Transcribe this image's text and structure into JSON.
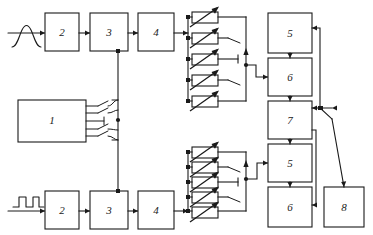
{
  "diagram": {
    "canvas": {
      "width": 373,
      "height": 235
    },
    "ink_color": "#1a1a1a",
    "background_color": "#ffffff"
  },
  "inputs": [
    {
      "id": "input-top",
      "waveform": "bell-pulse-waveform",
      "position": "top-left",
      "feeds": "block-2-top"
    },
    {
      "id": "input-bottom",
      "waveform": "square-pulse-waveform",
      "position": "bottom-left",
      "feeds": "block-2-bottom"
    }
  ],
  "blocks": [
    {
      "id": "block-1",
      "label": "1",
      "row": "middle-left",
      "x": 18,
      "y": 100,
      "w": 68,
      "h": 42
    },
    {
      "id": "block-2-top",
      "label": "2",
      "row": "top",
      "x": 45,
      "y": 13,
      "w": 34,
      "h": 38
    },
    {
      "id": "block-3-top",
      "label": "3",
      "row": "top",
      "x": 90,
      "y": 13,
      "w": 38,
      "h": 38
    },
    {
      "id": "block-4-top",
      "label": "4",
      "row": "top",
      "x": 138,
      "y": 13,
      "w": 36,
      "h": 38
    },
    {
      "id": "block-2-bottom",
      "label": "2",
      "row": "bottom",
      "x": 45,
      "y": 191,
      "w": 34,
      "h": 38
    },
    {
      "id": "block-3-bottom",
      "label": "3",
      "row": "bottom",
      "x": 90,
      "y": 191,
      "w": 38,
      "h": 38
    },
    {
      "id": "block-4-bottom",
      "label": "4",
      "row": "bottom",
      "x": 138,
      "y": 191,
      "w": 36,
      "h": 38
    },
    {
      "id": "block-5-top",
      "label": "5",
      "row": "right",
      "x": 268,
      "y": 13,
      "w": 44,
      "h": 40
    },
    {
      "id": "block-6-top",
      "label": "6",
      "row": "right",
      "x": 268,
      "y": 58,
      "w": 44,
      "h": 38
    },
    {
      "id": "block-7",
      "label": "7",
      "row": "right",
      "x": 268,
      "y": 101,
      "w": 44,
      "h": 38
    },
    {
      "id": "block-5-bottom",
      "label": "5",
      "row": "right",
      "x": 268,
      "y": 144,
      "w": 44,
      "h": 38
    },
    {
      "id": "block-6-bottom",
      "label": "6",
      "row": "right",
      "x": 268,
      "y": 187,
      "w": 44,
      "h": 40
    },
    {
      "id": "block-8",
      "label": "8",
      "row": "right",
      "x": 324,
      "y": 187,
      "w": 40,
      "h": 40
    }
  ],
  "attenuator_arrays": [
    {
      "id": "attenuator-array-top",
      "label": "variable attenuator bank (top)",
      "element_count": 5,
      "element_symbol": "variable-resistor",
      "rows": [
        {
          "index": 1,
          "right_termination": "bus"
        },
        {
          "index": 2,
          "right_termination": "switch-contact"
        },
        {
          "index": 3,
          "right_termination": "open-stub"
        },
        {
          "index": 4,
          "right_termination": "switch-contact"
        },
        {
          "index": 5,
          "right_termination": "bus"
        }
      ]
    },
    {
      "id": "attenuator-array-bottom",
      "label": "variable attenuator bank (bottom)",
      "element_count": 5,
      "element_symbol": "variable-resistor",
      "rows": [
        {
          "index": 1,
          "right_termination": "bus"
        },
        {
          "index": 2,
          "right_termination": "switch-contact"
        },
        {
          "index": 3,
          "right_termination": "open-stub"
        },
        {
          "index": 4,
          "right_termination": "switch-contact"
        },
        {
          "index": 5,
          "right_termination": "bus"
        }
      ]
    }
  ],
  "switches": [
    {
      "id": "switch-bank-block-1",
      "label": "block 1 output switch fan-out",
      "contact_count": 5,
      "closed_contacts": [
        3
      ],
      "open_contacts": [
        1,
        2,
        4,
        5
      ]
    },
    {
      "id": "switch-mode-selector",
      "label": "mode selector switch",
      "type": "spdt",
      "pole": "block-7-output",
      "throw_a": "feedback-loop",
      "throw_b": "block-8"
    }
  ],
  "connections": [
    {
      "from": "input-top",
      "to": "block-2-top"
    },
    {
      "from": "block-2-top",
      "to": "block-3-top"
    },
    {
      "from": "block-3-top",
      "to": "block-4-top"
    },
    {
      "from": "block-4-top",
      "to": "attenuator-array-top"
    },
    {
      "from": "attenuator-array-top",
      "to": "block-6-top"
    },
    {
      "from": "block-5-top",
      "to": "block-6-top"
    },
    {
      "from": "block-6-top",
      "to": "block-7"
    },
    {
      "from": "block-7",
      "to": "block-5-bottom"
    },
    {
      "from": "block-5-bottom",
      "to": "block-6-bottom"
    },
    {
      "from": "input-bottom",
      "to": "block-2-bottom"
    },
    {
      "from": "block-2-bottom",
      "to": "block-3-bottom"
    },
    {
      "from": "block-3-bottom",
      "to": "block-4-bottom"
    },
    {
      "from": "block-4-bottom",
      "to": "attenuator-array-bottom"
    },
    {
      "from": "attenuator-array-bottom",
      "to": "block-5-bottom"
    },
    {
      "from": "block-1",
      "to": "switch-bank-block-1"
    },
    {
      "from": "switch-bank-block-1",
      "to": "block-3-top"
    },
    {
      "from": "switch-bank-block-1",
      "to": "block-3-bottom"
    },
    {
      "from": "block-7",
      "to": "switch-mode-selector"
    },
    {
      "from": "switch-mode-selector",
      "to": "block-8"
    },
    {
      "from": "switch-mode-selector",
      "to": "block-5-top"
    },
    {
      "from": "block-7",
      "to": "block-6-bottom"
    }
  ]
}
